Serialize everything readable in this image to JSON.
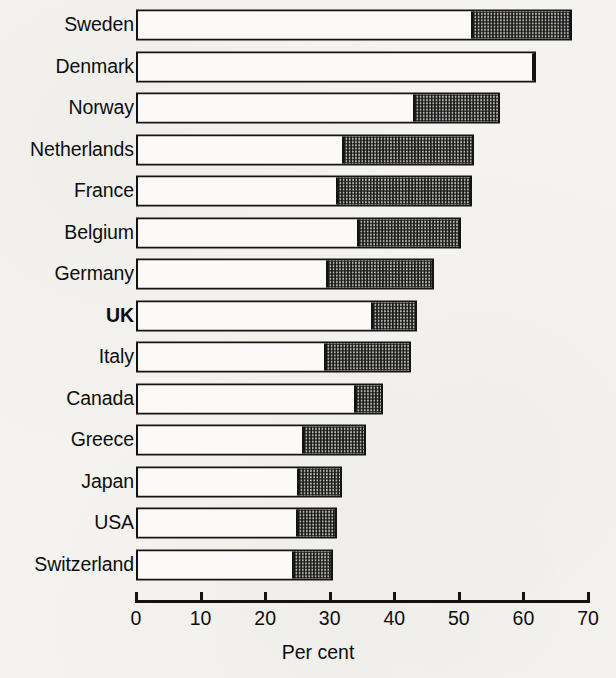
{
  "chart_data": {
    "type": "bar",
    "orientation": "horizontal",
    "stacked": true,
    "title": "",
    "subtitle": "",
    "xlabel": "Per cent",
    "ylabel": "",
    "xlim": [
      0,
      70
    ],
    "xticks": [
      0,
      10,
      20,
      30,
      40,
      50,
      60,
      70
    ],
    "xtick_labels": [
      "0",
      "10",
      "20",
      "30",
      "40",
      "50",
      "60",
      "70"
    ],
    "grid": false,
    "legend": "none",
    "categories": [
      "Sweden",
      "Denmark",
      "Norway",
      "Netherlands",
      "France",
      "Belgium",
      "Germany",
      "UK",
      "Italy",
      "Canada",
      "Greece",
      "Japan",
      "USA",
      "Switzerland"
    ],
    "highlighted_category": "UK",
    "series": [
      {
        "name": "lower-segment",
        "fill": "white",
        "color": "#fbfaf8",
        "values": [
          51.6,
          61.4,
          42.6,
          31.6,
          30.6,
          33.9,
          29.1,
          36.1,
          28.8,
          33.4,
          25.4,
          24.7,
          24.4,
          23.8
        ]
      },
      {
        "name": "upper-segment",
        "fill": "checkered",
        "color": "#b9b7b2",
        "values": [
          15.9,
          0.5,
          13.7,
          20.8,
          21.4,
          16.5,
          17.1,
          7.4,
          13.8,
          4.9,
          10.2,
          7.2,
          6.7,
          6.7
        ]
      }
    ],
    "totals": [
      67.5,
      61.9,
      56.3,
      52.4,
      52.0,
      50.4,
      46.2,
      43.5,
      42.6,
      38.3,
      35.6,
      31.9,
      31.1,
      30.5
    ]
  },
  "axis": {
    "title": "Per cent"
  },
  "colors": {
    "ink": "#131313",
    "paper": "#f4f3f0",
    "bar_white": "#fbfaf8",
    "bar_hatch": "#b9b7b2"
  }
}
